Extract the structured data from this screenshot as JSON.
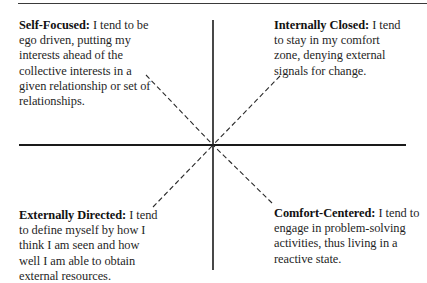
{
  "diagram": {
    "type": "quadrant",
    "axes": {
      "vertical": "solid",
      "horizontal": "solid",
      "diagonals": "dashed"
    },
    "quadrants": {
      "top_left": {
        "title": "Self-Focused:",
        "body": " I tend to be ego driven, putting my interests ahead of the collective interests in a given relationship or set of relationships."
      },
      "top_right": {
        "title": "Internally Closed:",
        "body": " I tend to stay in my comfort zone, denying external signals for change."
      },
      "bottom_left": {
        "title": "Externally Directed:",
        "body": " I tend to define myself by how I think I am seen and how well I am able to obtain external resources."
      },
      "bottom_right": {
        "title": "Comfort-Centered:",
        "body": " I tend to engage in problem-solving activities, thus living in a reactive state."
      }
    },
    "colors": {
      "line": "#1a1a1a",
      "text": "#1f1f1f",
      "background": "#ffffff"
    }
  }
}
